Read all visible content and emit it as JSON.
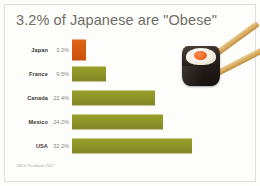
{
  "title": "3.2% of Japanese are \"Obese\"",
  "source": "OECD Factbook 2007",
  "photo": {
    "subject": "sushi-roll-with-chopsticks"
  },
  "chart_data": {
    "type": "bar",
    "orientation": "horizontal",
    "title": "3.2% of Japanese are \"Obese\"",
    "xlabel": "",
    "ylabel": "",
    "xlim": [
      0,
      32.2
    ],
    "grid": false,
    "legend": false,
    "categories": [
      "Japan",
      "France",
      "Canada",
      "Mexico",
      "USA"
    ],
    "values": [
      3.2,
      9.5,
      22.4,
      24.2,
      32.2
    ],
    "value_labels": [
      "3.2%",
      "9.5%",
      "22.4%",
      "24.2%",
      "32.2%"
    ],
    "unit": "%",
    "colors": [
      "#d75911",
      "#8e9326",
      "#8e9326",
      "#8e9326",
      "#8e9326"
    ],
    "highlight_category": "Japan",
    "highlight_color": "#d75911",
    "series_color": "#8e9326",
    "bars": [
      {
        "label": "Japan",
        "value": 3.2,
        "value_text": "3.2%",
        "color": "#d75911",
        "bar_px": 14,
        "row_top": 0,
        "tall": true
      },
      {
        "label": "France",
        "value": 9.5,
        "value_text": "9.5%",
        "color": "#8e9326",
        "bar_px": 34,
        "row_top": 24,
        "tall": false
      },
      {
        "label": "Canada",
        "value": 22.4,
        "value_text": "22.4%",
        "color": "#8e9326",
        "bar_px": 83,
        "row_top": 48,
        "tall": false
      },
      {
        "label": "Mexico",
        "value": 24.2,
        "value_text": "24.2%",
        "color": "#8e9326",
        "bar_px": 91,
        "row_top": 72,
        "tall": false
      },
      {
        "label": "USA",
        "value": 32.2,
        "value_text": "32.2%",
        "color": "#8e9326",
        "bar_px": 120,
        "row_top": 96,
        "tall": false
      }
    ]
  }
}
